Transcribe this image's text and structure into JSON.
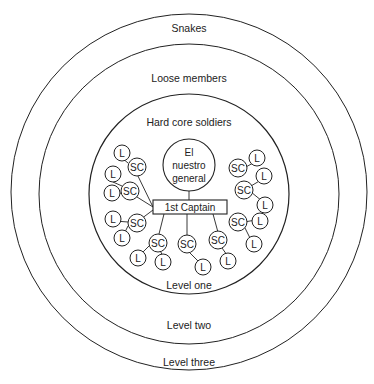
{
  "diagram": {
    "rings": [
      {
        "id": "level-three",
        "level_label": "Level three",
        "group_label": "Snakes",
        "cx": 189,
        "cy": 192,
        "r": 178
      },
      {
        "id": "level-two",
        "level_label": "Level two",
        "group_label": "Loose members",
        "cx": 189,
        "cy": 194,
        "r": 150
      },
      {
        "id": "level-one",
        "level_label": "Level one",
        "group_label": "Hard core soldiers",
        "cx": 189,
        "cy": 194,
        "r": 100
      }
    ],
    "general": {
      "line1": "El",
      "line2": "nuestro",
      "line3": "general",
      "cx": 189,
      "cy": 165,
      "r": 26
    },
    "captain": {
      "label": "1st Captain",
      "x": 153,
      "y": 200,
      "w": 74,
      "h": 14
    },
    "sc_label": "SC",
    "l_label": "L",
    "colors": {
      "stroke": "#222222",
      "background": "#ffffff"
    }
  }
}
